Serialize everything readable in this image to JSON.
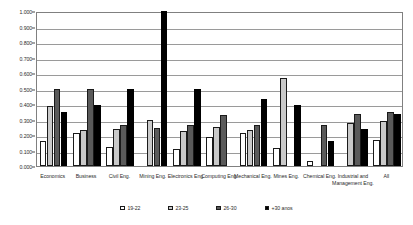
{
  "chart_data": {
    "type": "bar",
    "title": "",
    "subtitle": "",
    "xlabel": "",
    "ylabel": "",
    "ylim": [
      0.0,
      1.0
    ],
    "ytick_labels": [
      "1.000",
      "0.900",
      "0.800",
      "0.700",
      "0.600",
      "0.500",
      "0.400",
      "0.300",
      "0.200",
      "0.100",
      "0.000"
    ],
    "ytick_values": [
      1.0,
      0.9,
      0.8,
      0.7,
      0.6,
      0.5,
      0.4,
      0.3,
      0.2,
      0.1,
      0.0
    ],
    "grid": true,
    "legend_position": "bottom",
    "categories": [
      "Economics",
      "Business",
      "Civil Eng.",
      "Mining Eng.",
      "Electronics Eng.",
      "Computing Eng.",
      "Mechanical Eng.",
      "Mines Eng.",
      "Chemical Eng.",
      "Industrial and Management Eng.",
      "All"
    ],
    "series": [
      {
        "name": "19-22",
        "color": "#ffffff",
        "values": [
          0.16,
          0.215,
          0.12,
          0.0,
          0.11,
          0.19,
          0.215,
          0.115,
          0.03,
          0.0,
          0.165
        ]
      },
      {
        "name": "23-25",
        "color": "#c9c9c9",
        "values": [
          0.385,
          0.235,
          0.24,
          0.295,
          0.225,
          0.25,
          0.235,
          0.565,
          0.0,
          0.275,
          0.29
        ]
      },
      {
        "name": "26-30",
        "color": "#5a5a5a",
        "values": [
          0.5,
          0.5,
          0.265,
          0.248,
          0.265,
          0.33,
          0.265,
          0.0,
          0.265,
          0.335,
          0.35
        ]
      },
      {
        "name": "+30 anos",
        "color": "#000000",
        "values": [
          0.35,
          0.395,
          0.5,
          1.0,
          0.5,
          0.0,
          0.43,
          0.395,
          0.16,
          0.24,
          0.335
        ]
      }
    ]
  },
  "axis": {
    "y_label_unit": "",
    "x_label_unit": ""
  }
}
